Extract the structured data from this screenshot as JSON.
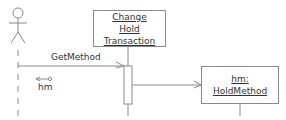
{
  "diagram": {
    "type": "uml-sequence",
    "actor": {
      "name": "",
      "icon": "stick-figure-icon"
    },
    "lifelines": [
      {
        "id": "change-hold-transaction",
        "label_lines": [
          "Change",
          "Hold",
          "Transaction"
        ]
      },
      {
        "id": "hold-method",
        "label_lines": [
          "hm:",
          "HoldMethod"
        ]
      }
    ],
    "messages": [
      {
        "from": "actor",
        "to": "change-hold-transaction",
        "label": "GetMethod",
        "kind": "call"
      },
      {
        "from": "change-hold-transaction",
        "to": "actor",
        "label": "hm",
        "kind": "return-data-token"
      },
      {
        "from": "change-hold-transaction",
        "to": "hold-method",
        "label": "",
        "kind": "create"
      }
    ]
  },
  "colors": {
    "line": "#8a8a8a",
    "text": "#333333"
  }
}
